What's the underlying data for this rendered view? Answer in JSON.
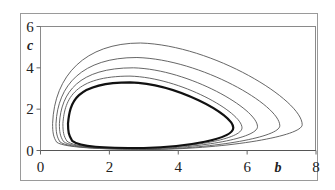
{
  "chart_data": {
    "type": "line",
    "title": "",
    "xlabel": "b",
    "ylabel": "c",
    "xlim": [
      0,
      8
    ],
    "ylim": [
      0,
      6
    ],
    "x_ticks": [
      "0",
      "2",
      "4",
      "6",
      "8"
    ],
    "y_ticks": [
      "0",
      "2",
      "4",
      "6"
    ],
    "grid": false,
    "legend": null,
    "series": [
      {
        "name": "orbit-1",
        "bold": false,
        "b_min": 0.35,
        "b_max": 7.6,
        "c_max": 5.2,
        "c_min": 0.05,
        "peak_b": 2.9,
        "tip_c": 1.25
      },
      {
        "name": "orbit-2",
        "bold": false,
        "b_min": 0.45,
        "b_max": 6.95,
        "c_max": 4.5,
        "c_min": 0.06,
        "peak_b": 2.8,
        "tip_c": 1.2
      },
      {
        "name": "orbit-3",
        "bold": false,
        "b_min": 0.55,
        "b_max": 6.3,
        "c_max": 4.0,
        "c_min": 0.08,
        "peak_b": 2.7,
        "tip_c": 1.15
      },
      {
        "name": "orbit-4",
        "bold": false,
        "b_min": 0.65,
        "b_max": 5.85,
        "c_max": 3.6,
        "c_min": 0.1,
        "peak_b": 2.6,
        "tip_c": 1.1
      },
      {
        "name": "orbit-bold",
        "bold": true,
        "b_min": 0.8,
        "b_max": 5.6,
        "c_max": 3.3,
        "c_min": 0.12,
        "peak_b": 2.6,
        "tip_c": 1.1
      }
    ]
  }
}
